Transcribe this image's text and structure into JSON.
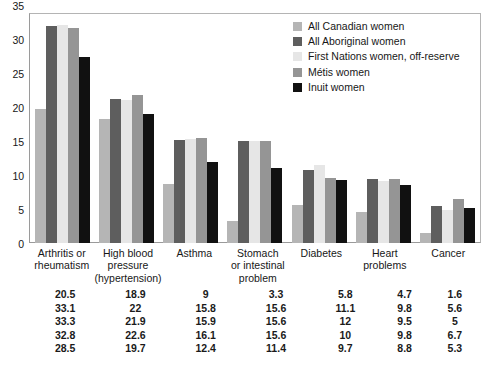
{
  "chart_data": {
    "type": "bar",
    "title": "",
    "subtitle": "",
    "xlabel": "",
    "ylabel": "",
    "ylim": [
      0,
      35
    ],
    "yticks": [
      "0",
      "5",
      "10",
      "15",
      "20",
      "25",
      "30",
      "35"
    ],
    "grid": false,
    "legend_position": "top-right",
    "categories": [
      "Arthritis or rheumatism",
      "High blood pressure (hypertension)",
      "Asthma",
      "Stomach or intestinal problem",
      "Diabetes",
      "Heart problems",
      "Cancer"
    ],
    "category_lines": [
      [
        "Arthritis or",
        "rheumatism"
      ],
      [
        "High blood",
        "pressure",
        "(hypertension)"
      ],
      [
        "Asthma"
      ],
      [
        "Stomach",
        "or intestinal",
        "problem"
      ],
      [
        "Diabetes"
      ],
      [
        "Heart",
        "problems"
      ],
      [
        "Cancer"
      ]
    ],
    "series": [
      {
        "name": "All Canadian women",
        "color": "#b5b5b5",
        "values": [
          20.5,
          18.9,
          9,
          3.3,
          5.8,
          4.7,
          1.6
        ]
      },
      {
        "name": "All Aboriginal women",
        "color": "#5e5e5e",
        "values": [
          33.1,
          22,
          15.8,
          15.6,
          11.1,
          9.8,
          5.6
        ]
      },
      {
        "name": "First Nations women, off-reserve",
        "color": "#e6e6e6",
        "values": [
          33.3,
          21.9,
          15.9,
          15.6,
          12,
          9.5,
          5
        ]
      },
      {
        "name": "Métis women",
        "color": "#959595",
        "values": [
          32.8,
          22.6,
          16.1,
          15.6,
          10,
          9.8,
          6.7
        ]
      },
      {
        "name": "Inuit women",
        "color": "#111111",
        "values": [
          28.5,
          19.7,
          12.4,
          11.4,
          9.7,
          8.8,
          5.3
        ]
      }
    ],
    "table_rows": [
      [
        "20.5",
        "18.9",
        "9",
        "3.3",
        "5.8",
        "4.7",
        "1.6"
      ],
      [
        "33.1",
        "22",
        "15.8",
        "15.6",
        "11.1",
        "9.8",
        "5.6"
      ],
      [
        "33.3",
        "21.9",
        "15.9",
        "15.6",
        "12",
        "9.5",
        "5"
      ],
      [
        "32.8",
        "22.6",
        "16.1",
        "15.6",
        "10",
        "9.8",
        "6.7"
      ],
      [
        "28.5",
        "19.7",
        "12.4",
        "11.4",
        "9.7",
        "8.8",
        "5.3"
      ]
    ]
  }
}
